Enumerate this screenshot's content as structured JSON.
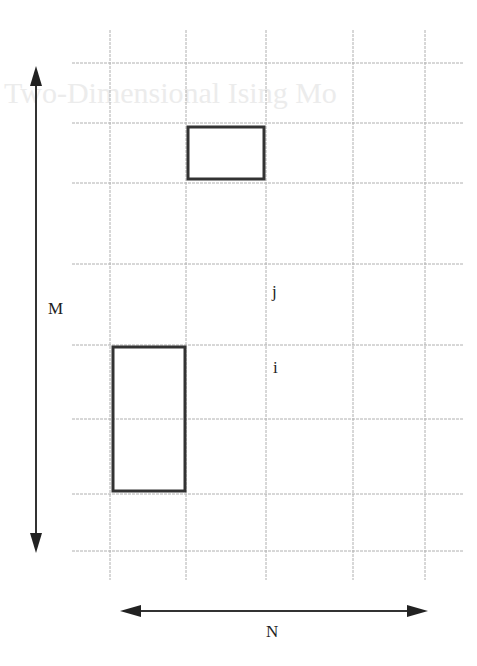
{
  "diagram": {
    "title_bleed": "Two-Dimensional Ising Mo",
    "labels": {
      "M": "M",
      "N": "N",
      "j": "j",
      "i": "i"
    },
    "grid": {
      "vertical_x": [
        110,
        186,
        266,
        353,
        425
      ],
      "horizontal_y": [
        63,
        123,
        183,
        264,
        345,
        419,
        494,
        551
      ],
      "x_range": [
        72,
        463
      ],
      "y_range": [
        30,
        580
      ],
      "line_color": "#b0b0b0"
    },
    "highlighted_cells": [
      {
        "name": "top-block",
        "x": 188,
        "y": 127,
        "w": 76,
        "h": 52
      },
      {
        "name": "left-block",
        "x": 113,
        "y": 347,
        "w": 72,
        "h": 144
      }
    ],
    "arrows": {
      "vertical": {
        "x": 36,
        "y1": 66,
        "y2": 553
      },
      "horizontal": {
        "y": 611,
        "x1": 120,
        "x2": 428
      }
    },
    "colors": {
      "stroke": "#333333",
      "grid": "#b0b0b0"
    }
  }
}
